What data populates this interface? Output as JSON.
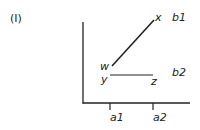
{
  "figure_label": "(I)",
  "points": {
    "w": "w",
    "x": "x",
    "y": "y",
    "z": "z"
  },
  "y_axis_labels": {
    "b1": "b1",
    "b2": "b2"
  },
  "x_axis_ticks": {
    "a1": "a1",
    "a2": "a2"
  },
  "colors": {
    "line": "#222222",
    "text": "#222222"
  }
}
